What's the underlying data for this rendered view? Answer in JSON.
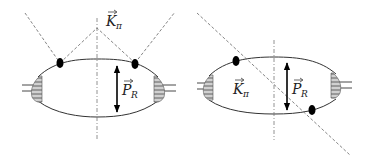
{
  "diagrams": [
    {
      "id": "left",
      "labels": {
        "k": "K",
        "k_sub": "π",
        "p": "P",
        "p_sub": "R"
      }
    },
    {
      "id": "right",
      "labels": {
        "k": "K",
        "k_sub": "π",
        "p": "P",
        "p_sub": "R"
      }
    }
  ],
  "colors": {
    "line": "#333333",
    "dash": "#777777",
    "vertex": "#000000",
    "blob": "#bbbbbb"
  }
}
